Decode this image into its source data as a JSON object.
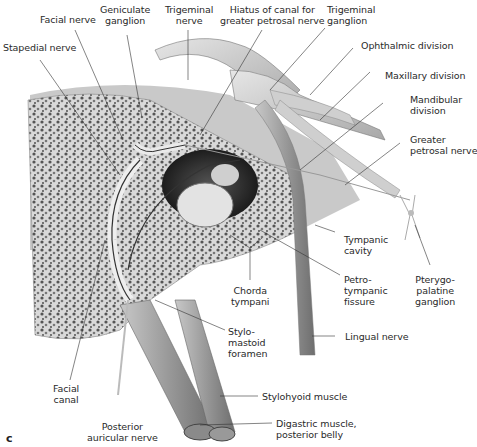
{
  "figure": {
    "panel_letter": "c",
    "labels": {
      "facial_nerve": "Facial nerve",
      "geniculate_ganglion": "Geniculate\nganglion",
      "trigeminal_nerve": "Trigeminal\nnerve",
      "hiatus": "Hiatus of canal for\ngreater petrosal nerve",
      "trigeminal_ganglion": "Trigeminal\nganglion",
      "stapedial_nerve": "Stapedial nerve",
      "ophthalmic_division": "Ophthalmic division",
      "maxillary_division": "Maxillary division",
      "mandibular_division": "Mandibular\ndivision",
      "greater_petrosal_nerve": "Greater\npetrosal nerve",
      "tympanic_cavity": "Tympanic\ncavity",
      "petrotympanic_fissure": "Petro-\ntympanic\nfissure",
      "pterygopalatine_ganglion": "Pterygo-\npalatine\nganglion",
      "chorda_tympani": "Chorda\ntympani",
      "stylomastoid_foramen": "Stylo-\nmastoid\nforamen",
      "lingual_nerve": "Lingual nerve",
      "facial_canal": "Facial\ncanal",
      "stylohyoid_muscle": "Stylohyoid muscle",
      "posterior_auricular_nerve": "Posterior\nauricular nerve",
      "digastric_muscle": "Digastric muscle,\nposterior belly"
    }
  }
}
